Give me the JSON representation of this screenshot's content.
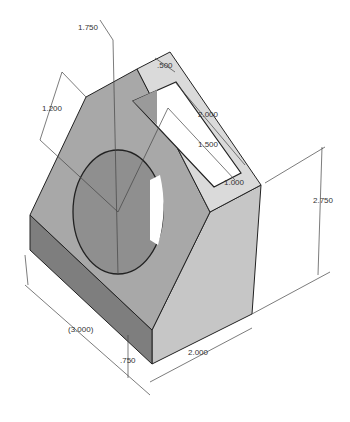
{
  "colors": {
    "background": "#ffffff",
    "top_face": "#d8d8d8",
    "sloped_face": "#a6a6a6",
    "front_base": "#7d7d7d",
    "right_face": "#c4c4c4",
    "slot_inner": "#9a9a9a",
    "edge": "#222222",
    "dim_line": "#444444"
  },
  "dimensions": {
    "hole_diameter": "1.750",
    "slot_offset": ".500",
    "slot_length": "2.000",
    "slot_inner_length": "1.500",
    "hole_offset": "1.200",
    "slot_width": "1.000",
    "height": "2.750",
    "length_ref": "(3.000)",
    "base_height": ".750",
    "width": "2.000"
  }
}
